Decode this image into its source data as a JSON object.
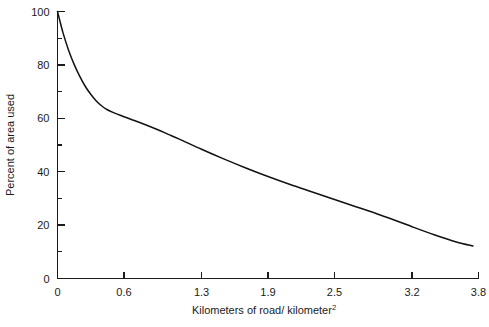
{
  "chart_data": {
    "type": "line",
    "title": "",
    "subtitle": "",
    "xlabel": "Kilometers of road/ kilometer",
    "xlabel_superscript": "2",
    "ylabel": "Percent of area used",
    "xlim": [
      0,
      3.8
    ],
    "ylim": [
      0,
      100
    ],
    "grid": false,
    "legend": null,
    "x_ticks": [
      "0",
      "0.6",
      "1.3",
      "1.9",
      "2.5",
      "3.2",
      "3.8"
    ],
    "x_tick_values": [
      0,
      0.6,
      1.3,
      1.9,
      2.5,
      3.2,
      3.8
    ],
    "y_ticks": [
      "0",
      "20",
      "40",
      "60",
      "80",
      "100"
    ],
    "y_tick_values": [
      0,
      20,
      40,
      60,
      80,
      100
    ],
    "y_minor_tick_values": [
      10,
      30,
      50,
      70,
      90
    ],
    "series": [
      {
        "name": "Percent of area used",
        "color": "#121212",
        "x": [
          0.0,
          0.05,
          0.1,
          0.15,
          0.2,
          0.25,
          0.3,
          0.35,
          0.4,
          0.45,
          0.5,
          0.6,
          0.7,
          0.8,
          0.9,
          1.0,
          1.1,
          1.3,
          1.5,
          1.7,
          1.9,
          2.1,
          2.3,
          2.5,
          2.7,
          2.9,
          3.1,
          3.2,
          3.4,
          3.6,
          3.75
        ],
        "y": [
          100.0,
          92.0,
          85.5,
          80.2,
          75.8,
          72.0,
          69.0,
          66.5,
          64.6,
          63.2,
          62.2,
          60.6,
          59.1,
          57.5,
          55.8,
          54.0,
          52.2,
          48.4,
          44.8,
          41.4,
          38.2,
          35.2,
          32.4,
          29.6,
          26.8,
          24.0,
          21.0,
          19.4,
          16.4,
          13.7,
          12.2
        ],
        "note": "Monotonically decreasing; steep hyperbolic drop from 100% to about 61% by 0.6, then a gentle near-linear decline to about 12% at 3.8"
      }
    ],
    "readings": [
      {
        "x": 0.0,
        "y": 100
      },
      {
        "x": 0.6,
        "y": 61
      },
      {
        "x": 1.3,
        "y": 48
      },
      {
        "x": 1.9,
        "y": 38
      },
      {
        "x": 2.5,
        "y": 30
      },
      {
        "x": 3.2,
        "y": 19
      },
      {
        "x": 3.8,
        "y": 12
      }
    ]
  }
}
